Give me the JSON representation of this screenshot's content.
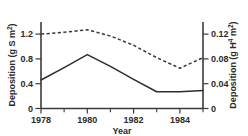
{
  "chart_data": {
    "type": "line",
    "title": "",
    "xlabel": "Year",
    "ylabel": "Deposition (g S m",
    "ylabel_sup": "-2",
    "ylabel_close": ")",
    "y2label": "Deposition (g H",
    "y2label_sup1": "+",
    "y2label_mid": " m",
    "y2label_sup2": "-2",
    "y2label_close": ")",
    "x": [
      1978,
      1979,
      1980,
      1981,
      1982,
      1983,
      1984,
      1985
    ],
    "xlim": [
      1978,
      1985
    ],
    "ylim": [
      0,
      1.4
    ],
    "y2lim": [
      0,
      0.14
    ],
    "grid": false,
    "legend": "none",
    "xticks": [
      1978,
      1979,
      1980,
      1981,
      1982,
      1983,
      1984,
      1985
    ],
    "xticklabels": [
      "1978",
      "",
      "1980",
      "",
      "1982",
      "",
      "1984",
      ""
    ],
    "yticks": [
      0,
      0.4,
      0.8,
      1.2
    ],
    "yticklabels": [
      "0",
      "0.4",
      "0.8",
      "1.2"
    ],
    "y2ticks": [
      0,
      0.04,
      0.08,
      0.12
    ],
    "y2ticklabels": [
      "0",
      "0.04",
      "0.08",
      "0.12"
    ],
    "series": [
      {
        "name": "Sulphur deposition",
        "axis": "left",
        "style": "solid",
        "values": [
          0.46,
          0.66,
          0.87,
          0.68,
          0.47,
          0.27,
          0.27,
          0.29
        ]
      },
      {
        "name": "Hydrogen ion deposition",
        "axis": "right",
        "style": "dashed",
        "values": [
          0.12,
          0.123,
          0.127,
          0.117,
          0.102,
          0.082,
          0.065,
          0.082
        ]
      }
    ]
  },
  "labels": {
    "y_tick_0": "0",
    "y_tick_1": "0.4",
    "y_tick_2": "0.8",
    "y_tick_3": "1.2",
    "y2_tick_0": "0",
    "y2_tick_1": "0.04",
    "y2_tick_2": "0.08",
    "y2_tick_3": "0.12",
    "x_tick_0": "1978",
    "x_tick_1": "1980",
    "x_tick_2": "1982",
    "x_tick_3": "1984",
    "x_title": "Year",
    "y_title_main": "Deposition (g S m",
    "y_title_sup": "2",
    "y_title_end": ")",
    "y2_title_main": "Deposition (g H",
    "y2_title_sup1": "4",
    "y2_title_mid": " m",
    "y2_title_sup2": "2",
    "y2_title_end": ")"
  }
}
